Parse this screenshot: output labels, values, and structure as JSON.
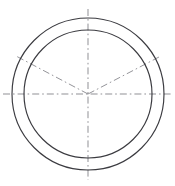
{
  "figure": {
    "title": "Concentric circles with centerlines and radial construction lines",
    "width": 175,
    "height": 186,
    "background_color": "#ffffff"
  },
  "geometry": {
    "center": {
      "x": 88,
      "y": 94,
      "label": "center-point"
    },
    "circles": [
      {
        "name": "outer-circle",
        "radius": 76,
        "line_style": "solid",
        "stroke_color": "#3b3b40",
        "stroke_width": 1.15
      },
      {
        "name": "inner-circle",
        "radius": 64,
        "line_style": "solid",
        "stroke_color": "#3b3b40",
        "stroke_width": 1.15
      }
    ],
    "centerlines": [
      {
        "name": "horizontal-centerline",
        "orientation": "horizontal",
        "line_style": "dash-dot",
        "stroke_color": "#8a8a8f",
        "from": {
          "x": 3,
          "y": 94
        },
        "to": {
          "x": 172,
          "y": 94
        }
      },
      {
        "name": "vertical-centerline",
        "orientation": "vertical",
        "line_style": "dash-dot",
        "stroke_color": "#8a8a8f",
        "from": {
          "x": 88,
          "y": 9
        },
        "to": {
          "x": 88,
          "y": 180
        }
      }
    ],
    "radial_lines": [
      {
        "name": "radial-line-upper-left",
        "angle_degrees": 152,
        "line_style": "dash-dot",
        "stroke_color": "#8e8e93",
        "from": {
          "x": 88,
          "y": 94
        },
        "to": {
          "x": 16,
          "y": 56
        }
      },
      {
        "name": "radial-line-upper-right",
        "angle_degrees": 28,
        "line_style": "dash-dot",
        "stroke_color": "#8e8e93",
        "from": {
          "x": 88,
          "y": 94
        },
        "to": {
          "x": 159,
          "y": 57
        }
      }
    ]
  },
  "line_style_definitions": {
    "dash_dot_pattern": "7 3 1.6 3",
    "solid_pattern": "none"
  }
}
